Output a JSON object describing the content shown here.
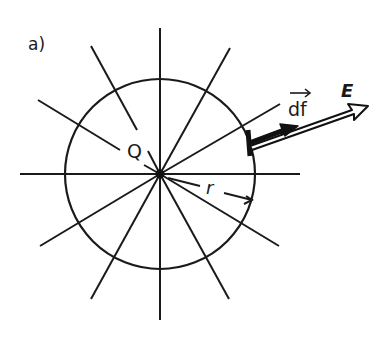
{
  "figure": {
    "panel_label": "a)",
    "charge_label": "Q",
    "radius_label": "r",
    "area_vector_label": "df",
    "field_label": "E"
  },
  "geometry": {
    "center": [
      160,
      174
    ],
    "circle_radius": 95,
    "spoke_count": 12,
    "spoke_length": 140,
    "ink_color": "#1a1a1a"
  }
}
